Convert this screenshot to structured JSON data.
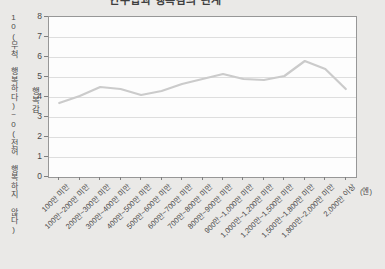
{
  "window": {
    "background_color": "#eae9e7"
  },
  "chart_data": {
    "type": "line",
    "title": "연수입과 행복감의 관계",
    "title_clipped_at_top": true,
    "categories": [
      "100만 미만",
      "100만~200만 미만",
      "200만~300만 미만",
      "300만~400만 미만",
      "400만~500만 미만",
      "500만~600만 미만",
      "600만~700만 미만",
      "700만~800만 미만",
      "800만~900만 미만",
      "900만~1,000만 미만",
      "1,000만~1,200만 미만",
      "1,200만~1,500만 미만",
      "1,500만~1,800만 미만",
      "1,800만~2,000만 미만",
      "2,000만 이상"
    ],
    "values": [
      3.7,
      4.05,
      4.5,
      4.4,
      4.1,
      4.3,
      4.65,
      4.9,
      5.15,
      4.9,
      4.85,
      5.05,
      5.8,
      5.4,
      4.4
    ],
    "ylabel": "행복감",
    "y_axis_annotation": "10(무척 행복하다)~0(전혀 행복하지 않다)",
    "x_unit_label": "(엔)",
    "ylim": [
      0,
      8
    ],
    "yticks": [
      0,
      1,
      2,
      3,
      4,
      5,
      6,
      7,
      8
    ],
    "grid": true,
    "legend": "none",
    "line_color": "#cbcbcb",
    "grid_color": "#dedede",
    "axis_color": "#979797",
    "tick_color": "#7f7f7f",
    "label_color": "#4a4a4a"
  }
}
